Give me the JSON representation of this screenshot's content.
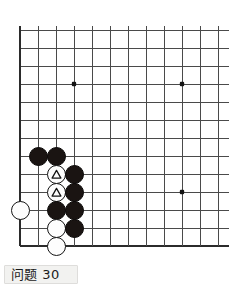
{
  "diagram": {
    "kind": "go-board-problem",
    "caption": "问题 30",
    "caption_number": "30",
    "corner_marker_icon": "corner-triangle-icon",
    "board": {
      "grid_label": "go-grid",
      "visible_columns": 12,
      "visible_rows": 13,
      "left_edge_is_board_edge": true,
      "bottom_edge_is_board_edge": true,
      "right_edge_cropped": true,
      "top_edge_cropped": false,
      "line_color": "#4a4a4a",
      "edge_line_color": "#2b2b2b",
      "background_color": "#ffffff",
      "origin_x": 20,
      "origin_y": 30,
      "spacing": 18,
      "star_points": [
        {
          "col": 3,
          "row": 3,
          "name": "star-point-upper-left"
        },
        {
          "col": 9,
          "row": 3,
          "name": "star-point-upper-right"
        },
        {
          "col": 9,
          "row": 9,
          "name": "star-point-lower-right"
        }
      ],
      "star_point_color": "#151515"
    },
    "stone_radius": 9.5,
    "stones": [
      {
        "id": "b1",
        "color": "black",
        "col": 1,
        "row": 7,
        "mark": null,
        "name": "black-stone-b1"
      },
      {
        "id": "b2",
        "color": "black",
        "col": 2,
        "row": 7,
        "mark": null,
        "name": "black-stone-b2"
      },
      {
        "id": "w1",
        "color": "white",
        "col": 2,
        "row": 8,
        "mark": "triangle",
        "name": "white-stone-marked-w1"
      },
      {
        "id": "b3",
        "color": "black",
        "col": 3,
        "row": 8,
        "mark": null,
        "name": "black-stone-b3"
      },
      {
        "id": "w2",
        "color": "white",
        "col": 2,
        "row": 9,
        "mark": "triangle",
        "name": "white-stone-marked-w2"
      },
      {
        "id": "b4",
        "color": "black",
        "col": 3,
        "row": 9,
        "mark": null,
        "name": "black-stone-b4"
      },
      {
        "id": "w3",
        "color": "white",
        "col": 0,
        "row": 10,
        "mark": null,
        "name": "white-stone-w3"
      },
      {
        "id": "b5",
        "color": "black",
        "col": 2,
        "row": 10,
        "mark": null,
        "name": "black-stone-b5"
      },
      {
        "id": "b6",
        "color": "black",
        "col": 3,
        "row": 10,
        "mark": null,
        "name": "black-stone-b6"
      },
      {
        "id": "w4",
        "color": "white",
        "col": 2,
        "row": 11,
        "mark": null,
        "name": "white-stone-w4"
      },
      {
        "id": "b7",
        "color": "black",
        "col": 3,
        "row": 11,
        "mark": null,
        "name": "black-stone-b7"
      },
      {
        "id": "w5",
        "color": "white",
        "col": 2,
        "row": 12,
        "mark": null,
        "name": "white-stone-w5"
      }
    ],
    "marked_stone_count": 2,
    "black_stone_count": 7,
    "white_stone_count": 5
  }
}
